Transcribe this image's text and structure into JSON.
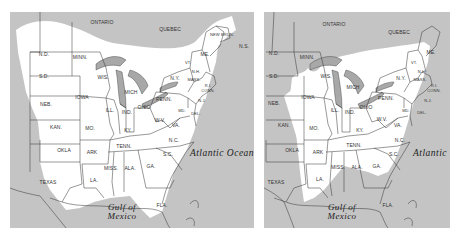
{
  "figure": {
    "maps": [
      {
        "id": "left",
        "labels": {
          "ontario": "ONTARIO",
          "quebec": "QUEBEC",
          "newbrun": "NEW BRUN.",
          "ns": "N.S.",
          "nd": "N.D.",
          "sd": "S.D.",
          "neb": "NEB.",
          "kan": "KAN.",
          "okla": "OKLA",
          "texas": "TEXAS",
          "minn": "MINN.",
          "iowa": "IOWA",
          "mo": "MO.",
          "ark": "ARK",
          "la": "LA.",
          "wis": "WIS.",
          "mich": "MICH",
          "ill": "ILL.",
          "ind": "IND.",
          "ohio": "OHIO",
          "ky": "KY.",
          "tenn": "TENN.",
          "miss": "MISS.",
          "ala": "ALA.",
          "ga": "GA.",
          "fla": "FLA.",
          "penn": "PENN.",
          "ny": "N.Y.",
          "me": "ME.",
          "vt": "VT.",
          "nh": "N.H.",
          "mass": "MASS.",
          "ri": "R.I.",
          "conn": "CONN.",
          "nj": "N.J.",
          "del": "DEL.",
          "md": "MD.",
          "wv": "W.V.",
          "va": "VA.",
          "nc": "N.C.",
          "sc": "S.C."
        },
        "water": {
          "atlantic": "Atlantic Ocean",
          "gulf_line1": "Gulf of",
          "gulf_line2": "Mexico"
        }
      },
      {
        "id": "right",
        "labels": {
          "ontario": "ONTARIO",
          "quebec": "QUEBEC",
          "nd": "N.D.",
          "sd": "S.D.",
          "neb": "NEB.",
          "kan": "KAN.",
          "okla": "OKLA",
          "texas": "TEXAS",
          "minn": "MINN.",
          "iowa": "IOWA",
          "mo": "MO.",
          "ark": "ARK",
          "la": "LA.",
          "wis": "WIS.",
          "mich": "MICH",
          "ill": "ILL.",
          "ind": "IND.",
          "ohio": "OHIO",
          "ky": "KY.",
          "tenn": "TENN.",
          "miss": "MISS.",
          "ala": "ALA.",
          "ga": "GA.",
          "fla": "FLA.",
          "penn": "PENN.",
          "ny": "N.Y.",
          "me": "ME.",
          "vt": "VT.",
          "nh": "N.H.",
          "mass": "MASS.",
          "ri": "R.I.",
          "conn": "CONN.",
          "nj": "N.J.",
          "del": "DEL.",
          "md": "MD.",
          "wv": "W.V.",
          "va": "VA.",
          "nc": "N.C.",
          "sc": "S.C."
        },
        "water": {
          "atlantic": "Atlantic",
          "gulf_line1": "Gulf of",
          "gulf_line2": "Mexico"
        }
      }
    ],
    "colors": {
      "background": "#c4c4c4",
      "range": "#ffffff",
      "border": "#333333",
      "lakes": "#a8a8a8"
    }
  }
}
